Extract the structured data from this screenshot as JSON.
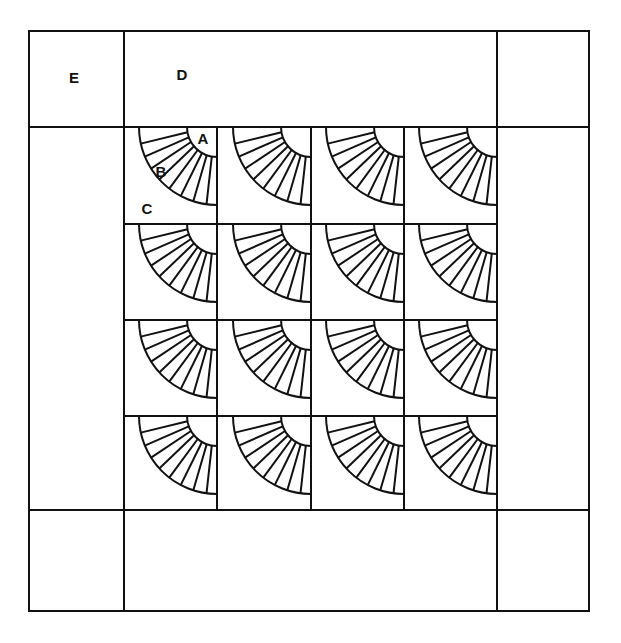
{
  "colors": {
    "line": "#111111",
    "background": "#ffffff"
  },
  "layout": {
    "outer": {
      "left": 29,
      "top": 31,
      "right": 589,
      "bottom": 611
    },
    "border": {
      "left_inner": 124,
      "right_inner": 497,
      "top_inner": 127,
      "bottom_inner": 510
    },
    "grid_columns": [
      124,
      217,
      311,
      404,
      497
    ],
    "grid_rows": [
      127,
      224,
      320,
      416,
      510
    ],
    "fan": {
      "inner_radius": 30,
      "outer_radius": 78,
      "blades": 9
    }
  },
  "labels": {
    "A": {
      "text": "A",
      "x": 203,
      "y": 144
    },
    "B": {
      "text": "B",
      "x": 161,
      "y": 177
    },
    "C": {
      "text": "C",
      "x": 147,
      "y": 214
    },
    "D": {
      "text": "D",
      "x": 182,
      "y": 80
    },
    "E": {
      "text": "E",
      "x": 74,
      "y": 83
    }
  },
  "legend_meaning": {
    "A": "fan center quarter-circle",
    "B": "fan blade",
    "C": "block background",
    "D": "border strip",
    "E": "corner square"
  }
}
